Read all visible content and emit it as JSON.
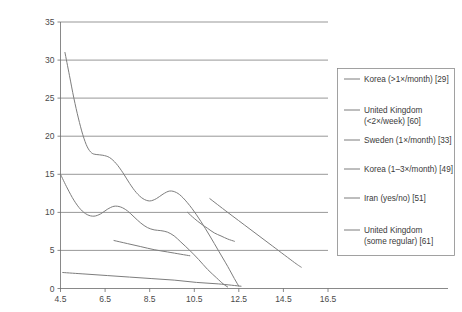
{
  "chart_data": {
    "type": "line",
    "title": "",
    "xlabel": "",
    "ylabel": "",
    "xlim": [
      4.5,
      16.5
    ],
    "ylim": [
      0,
      35
    ],
    "xticks": [
      "4.5",
      "6.5",
      "8.5",
      "10.5",
      "12.5",
      "14.5",
      "16.5"
    ],
    "yticks": [
      "0",
      "5",
      "10",
      "15",
      "20",
      "25",
      "30",
      "35"
    ],
    "grid": "horizontal",
    "legend_position": "right-outside",
    "series": [
      {
        "name": "Korea (>1×/month) [29]",
        "points": [
          [
            4.5,
            15.0
          ],
          [
            4.8,
            13.2
          ],
          [
            5.1,
            11.6
          ],
          [
            5.4,
            10.4
          ],
          [
            5.7,
            9.7
          ],
          [
            6.0,
            9.5
          ],
          [
            6.3,
            9.8
          ],
          [
            6.6,
            10.4
          ],
          [
            6.9,
            10.8
          ],
          [
            7.2,
            10.7
          ],
          [
            7.5,
            10.2
          ],
          [
            7.8,
            9.4
          ],
          [
            8.1,
            8.6
          ],
          [
            8.4,
            8.0
          ],
          [
            8.7,
            7.7
          ],
          [
            9.0,
            7.6
          ],
          [
            9.3,
            7.4
          ],
          [
            9.6,
            6.9
          ],
          [
            9.9,
            6.1
          ],
          [
            10.3,
            5.0
          ],
          [
            10.7,
            3.8
          ],
          [
            11.1,
            2.5
          ],
          [
            11.5,
            1.4
          ],
          [
            11.8,
            0.6
          ],
          [
            12.0,
            0.2
          ]
        ]
      },
      {
        "name": "United Kingdom (<2×/week) [60]",
        "points": [
          [
            4.7,
            31.0
          ],
          [
            4.9,
            28.0
          ],
          [
            5.1,
            25.0
          ],
          [
            5.3,
            22.4
          ],
          [
            5.5,
            20.2
          ],
          [
            5.7,
            18.6
          ],
          [
            5.9,
            17.8
          ],
          [
            6.1,
            17.6
          ],
          [
            6.4,
            17.5
          ],
          [
            6.7,
            17.2
          ],
          [
            7.0,
            16.4
          ],
          [
            7.3,
            15.2
          ],
          [
            7.6,
            13.8
          ],
          [
            7.9,
            12.6
          ],
          [
            8.2,
            11.8
          ],
          [
            8.5,
            11.5
          ],
          [
            8.8,
            11.8
          ],
          [
            9.1,
            12.4
          ],
          [
            9.4,
            12.8
          ],
          [
            9.7,
            12.6
          ],
          [
            10.0,
            11.9
          ],
          [
            10.4,
            10.5
          ],
          [
            10.8,
            8.8
          ],
          [
            11.2,
            6.9
          ],
          [
            11.6,
            4.9
          ],
          [
            12.0,
            2.9
          ],
          [
            12.3,
            1.3
          ],
          [
            12.5,
            0.3
          ]
        ]
      },
      {
        "name": "Sweden (1×/month) [33]",
        "points": [
          [
            6.9,
            6.3
          ],
          [
            7.5,
            5.9
          ],
          [
            8.1,
            5.5
          ],
          [
            8.7,
            5.1
          ],
          [
            9.3,
            4.8
          ],
          [
            9.9,
            4.5
          ],
          [
            10.3,
            4.3
          ]
        ]
      },
      {
        "name": "Korea (1–3×/month) [49]",
        "points": [
          [
            10.2,
            10.0
          ],
          [
            10.5,
            9.2
          ],
          [
            10.8,
            8.5
          ],
          [
            11.1,
            7.9
          ],
          [
            11.4,
            7.3
          ],
          [
            11.7,
            6.9
          ],
          [
            12.0,
            6.5
          ],
          [
            12.3,
            6.2
          ]
        ]
      },
      {
        "name": "Iran (yes/no) [51]",
        "points": [
          [
            4.6,
            2.1
          ],
          [
            5.6,
            1.9
          ],
          [
            6.6,
            1.7
          ],
          [
            7.6,
            1.5
          ],
          [
            8.6,
            1.3
          ],
          [
            9.6,
            1.1
          ],
          [
            10.6,
            0.8
          ],
          [
            11.6,
            0.6
          ],
          [
            12.6,
            0.3
          ]
        ]
      },
      {
        "name": "United Kingdom (some regular) [61]",
        "points": [
          [
            11.2,
            11.8
          ],
          [
            12.0,
            10.0
          ],
          [
            13.0,
            7.8
          ],
          [
            14.0,
            5.6
          ],
          [
            15.0,
            3.4
          ],
          [
            15.3,
            2.8
          ]
        ]
      }
    ],
    "legend": [
      {
        "label_line1": "Korea (>1×/month) [29]",
        "label_line2": ""
      },
      {
        "label_line1": "United Kingdom",
        "label_line2": "(<2×/week) [60]"
      },
      {
        "label_line1": "Sweden (1×/month) [33]",
        "label_line2": ""
      },
      {
        "label_line1": "Korea (1–3×/month) [49]",
        "label_line2": ""
      },
      {
        "label_line1": "Iran (yes/no) [51]",
        "label_line2": ""
      },
      {
        "label_line1": "United Kingdom",
        "label_line2": "(some regular) [61]"
      }
    ],
    "colors": {
      "series_line": "#7d7d7d",
      "gridline": "#6b6b6b",
      "axis": "#6b6b6b",
      "tick_text": "#4a4a4a",
      "legend_border": "#8a8a8a",
      "background": "#ffffff"
    }
  }
}
